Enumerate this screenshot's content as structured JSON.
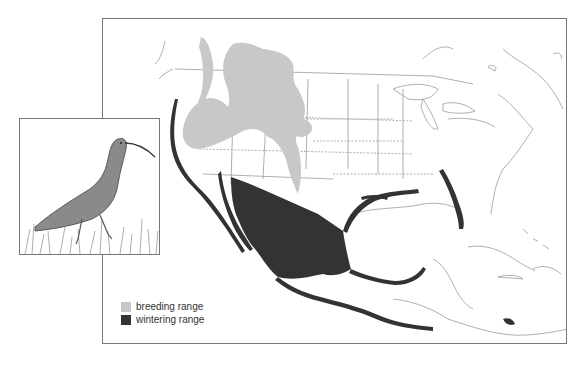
{
  "map": {
    "region": "North America",
    "colors": {
      "breeding": "#c8c8c8",
      "wintering": "#333333",
      "outline": "#8a8a8a",
      "frame": "#777777"
    }
  },
  "inset": {
    "subject": "long-billed curlew illustration"
  },
  "legend": {
    "items": [
      {
        "label": "breeding range",
        "color": "#c8c8c8"
      },
      {
        "label": "wintering range",
        "color": "#333333"
      }
    ]
  }
}
